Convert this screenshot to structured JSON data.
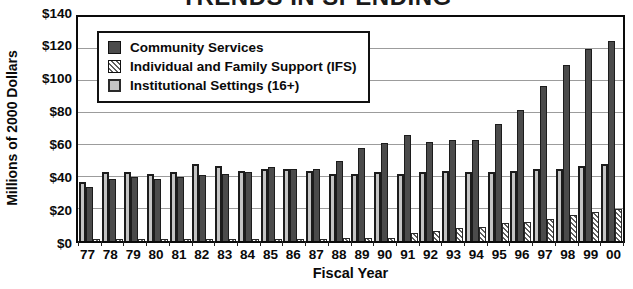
{
  "title": "TRENDS IN SPENDING",
  "chart_data": {
    "type": "bar",
    "title": "TRENDS IN SPENDING",
    "xlabel": "Fiscal Year",
    "ylabel": "Millions of 2000 Dollars",
    "ylim": [
      0,
      140
    ],
    "ytick_step": 20,
    "yticks": [
      {
        "value": 0,
        "label": "$0"
      },
      {
        "value": 20,
        "label": "$20"
      },
      {
        "value": 40,
        "label": "$40"
      },
      {
        "value": 60,
        "label": "$60"
      },
      {
        "value": 80,
        "label": "$80"
      },
      {
        "value": 100,
        "label": "$100"
      },
      {
        "value": 120,
        "label": "$120"
      },
      {
        "value": 140,
        "label": "$140"
      }
    ],
    "grid": true,
    "legend_position": "top-left",
    "categories": [
      "77",
      "78",
      "79",
      "80",
      "81",
      "82",
      "83",
      "84",
      "85",
      "86",
      "87",
      "88",
      "89",
      "90",
      "91",
      "92",
      "93",
      "94",
      "95",
      "96",
      "97",
      "98",
      "99",
      "00"
    ],
    "series": [
      {
        "name": "Community Services",
        "style": "solid-dark",
        "color": "#4b4b4b",
        "values": [
          34,
          39,
          40,
          39,
          40,
          41,
          42,
          43,
          46,
          45,
          45,
          50,
          58,
          61,
          66,
          62,
          63,
          63,
          73,
          82,
          97,
          110,
          120,
          125
        ]
      },
      {
        "name": "Individual and Family Support (IFS)",
        "style": "hatched",
        "color": "#ffffff",
        "values": [
          1,
          1,
          1,
          1,
          1,
          1,
          1,
          1,
          1,
          1,
          1,
          2,
          2,
          2,
          5,
          6,
          8,
          9,
          11,
          12,
          14,
          16,
          18,
          20
        ]
      },
      {
        "name": "Institutional Settings (16+)",
        "style": "solid-gray",
        "color": "#c4c4c4",
        "values": [
          37,
          43,
          43,
          42,
          43,
          48,
          47,
          44,
          45,
          45,
          44,
          42,
          42,
          43,
          42,
          43,
          44,
          43,
          43,
          44,
          45,
          45,
          47,
          48
        ]
      }
    ],
    "bar_order": [
      "Institutional Settings (16+)",
      "Community Services",
      "Individual and Family Support (IFS)"
    ]
  }
}
